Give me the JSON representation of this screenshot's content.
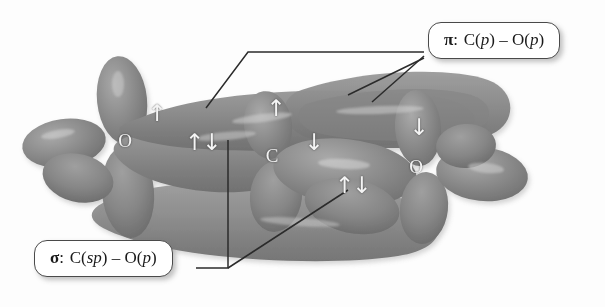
{
  "figure": {
    "type": "molecular-orbital-diagram",
    "molecule": "CO2",
    "background_color": "#fdfdfd",
    "orbital_color": "#8a8a8a",
    "label_color": "#f2f2f2",
    "line_color": "#2b2b2b"
  },
  "atoms": [
    {
      "symbol": "O",
      "x": 125,
      "y": 140
    },
    {
      "symbol": "C",
      "x": 272,
      "y": 155
    },
    {
      "symbol": "O",
      "x": 416,
      "y": 166
    }
  ],
  "spin_arrows": [
    {
      "name": "pi-upper-left",
      "glyph": "↑",
      "x": 156,
      "y": 113
    },
    {
      "name": "sigma-left-pair",
      "glyph": "↑↓",
      "x": 202,
      "y": 142
    },
    {
      "name": "pi-upper-right",
      "glyph": "↑",
      "x": 275,
      "y": 108
    },
    {
      "name": "pi-mid-down",
      "glyph": "↓",
      "x": 313,
      "y": 142
    },
    {
      "name": "sigma-right-pair",
      "glyph": "↑↓",
      "x": 352,
      "y": 185
    },
    {
      "name": "pi-far-right",
      "glyph": "↓",
      "x": 418,
      "y": 127
    }
  ],
  "callouts": {
    "pi": {
      "name": "pi-callout",
      "symbol": "π",
      "separator": ":",
      "left_atom": "C",
      "left_orbital": "p",
      "dash": "–",
      "right_atom": "O",
      "right_orbital": "p",
      "x": 428,
      "y": 22
    },
    "sigma": {
      "name": "sigma-callout",
      "symbol": "σ",
      "separator": ":",
      "left_atom": "C",
      "left_orbital": "sp",
      "dash": "–",
      "right_atom": "O",
      "right_orbital": "p",
      "x": 34,
      "y": 240
    }
  },
  "leader_lines": [
    {
      "name": "pi-leader-1",
      "points": "424,52 248,52 206,108"
    },
    {
      "name": "pi-leader-2",
      "points": "424,58 348,95"
    },
    {
      "name": "pi-leader-3",
      "points": "424,56 372,102"
    },
    {
      "name": "sigma-leader-1",
      "points": "196,268 228,268 228,140"
    },
    {
      "name": "sigma-leader-2",
      "points": "228,268 348,190"
    }
  ]
}
